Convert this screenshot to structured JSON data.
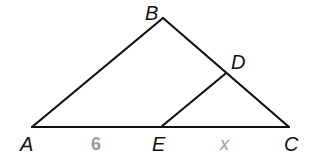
{
  "figure": {
    "type": "triangle-with-parallel-segment",
    "vertices": {
      "A": "A",
      "B": "B",
      "C": "C",
      "D": "D",
      "E": "E"
    },
    "segments": [
      "AB",
      "BC",
      "AC",
      "DE"
    ],
    "measures": {
      "AE": "6",
      "EC": "x"
    }
  }
}
